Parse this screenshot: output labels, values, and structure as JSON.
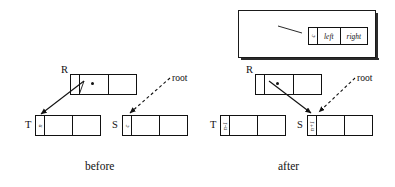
{
  "figure": {
    "title_caption_before": "before",
    "title_caption_after": "after"
  },
  "legend": {
    "annotation": "reference\ncount",
    "fields": {
      "count": "c",
      "left": "left",
      "right": "right"
    }
  },
  "panels": {
    "before": {
      "caption": "before",
      "root_label": "root",
      "nodes": {
        "r": {
          "name": "R",
          "refcount": ""
        },
        "t": {
          "name": "T",
          "refcount": "n"
        },
        "s": {
          "name": "S",
          "refcount": "c"
        }
      }
    },
    "after": {
      "caption": "after",
      "root_label": "root",
      "nodes": {
        "r": {
          "name": "R",
          "refcount": ""
        },
        "t": {
          "name": "T",
          "refcount": "n-1"
        },
        "s": {
          "name": "S",
          "refcount": "n+1"
        }
      }
    }
  },
  "colors": {
    "ink": "#111111",
    "paper": "#ffffff",
    "shadow": "#2b2b2b"
  }
}
